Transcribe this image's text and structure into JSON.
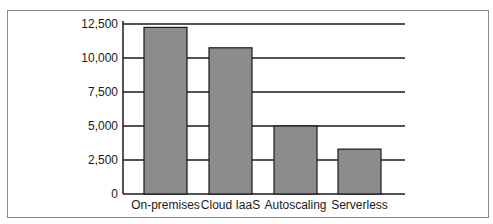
{
  "chart_data": {
    "type": "bar",
    "title": "",
    "xlabel": "",
    "ylabel": "",
    "categories": [
      "On-premises",
      "Cloud IaaS",
      "Autoscaling",
      "Serverless"
    ],
    "values": [
      12250,
      10750,
      5000,
      3300
    ],
    "ylim": [
      0,
      12500
    ],
    "yticks": [
      0,
      2500,
      5000,
      7500,
      10000,
      12500
    ],
    "ytick_labels": [
      "0",
      "2,500",
      "5,000",
      "7,500",
      "10,000",
      "12,500"
    ],
    "grid": true,
    "legend": null,
    "colors": {
      "bar_fill": "#8c8c8c",
      "bar_edge": "#1a1a1a",
      "grid": "#1a1a1a",
      "frame": "#8a8a8a"
    }
  }
}
